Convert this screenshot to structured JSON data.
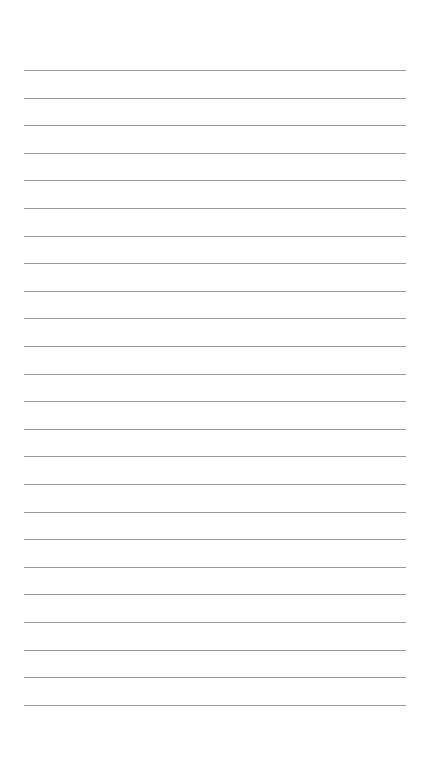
{
  "page": {
    "type": "lined-paper",
    "background_color": "#ffffff",
    "line_color": "#9a9a9a",
    "line_count": 24,
    "first_line_y": 70,
    "line_spacing": 27.6,
    "line_left": 24,
    "line_right": 406
  }
}
